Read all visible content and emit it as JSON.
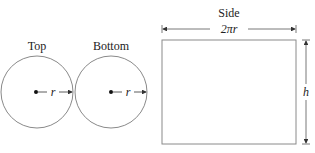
{
  "diagram": {
    "top_circle": {
      "title": "Top",
      "radius_label": "r"
    },
    "bottom_circle": {
      "title": "Bottom",
      "radius_label": "r"
    },
    "side_rectangle": {
      "title": "Side",
      "width_label": "2πr",
      "height_label": "h"
    }
  },
  "colors": {
    "stroke": "#8a8a8a",
    "text": "#222222",
    "background": "#ffffff"
  }
}
